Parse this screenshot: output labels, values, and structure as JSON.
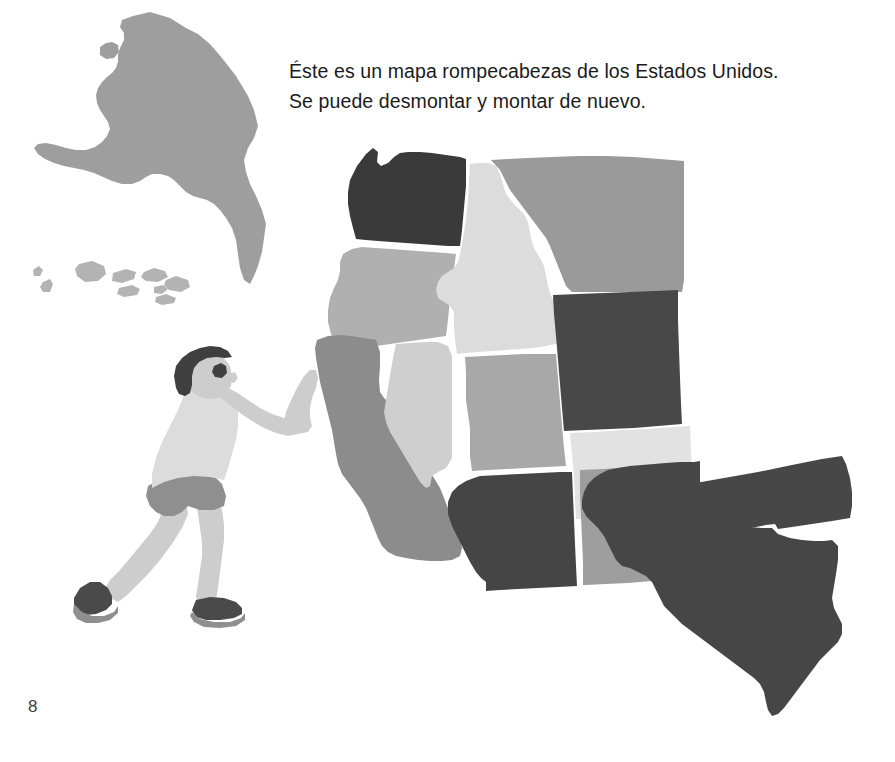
{
  "page": {
    "number": "8",
    "background_color": "#ffffff",
    "width": 895,
    "height": 762
  },
  "caption": {
    "line1": "Éste es un mapa rompecabezas de los Estados Unidos.",
    "line2": "Se puede desmontar y montar de nuevo.",
    "full_text": "Éste es un mapa rompecabezas de los Estados Unidos.\nSe puede desmontar y montar de nuevo.",
    "text_color": "#1b1b1b"
  },
  "illustration": {
    "title": "Boy pushing a jigsaw puzzle map of the United States",
    "figure": {
      "name": "boy",
      "action": "pushing-map",
      "colors": {
        "hair": "#3f3f3f",
        "skin": "#cdcdcd",
        "shirt": "#dcdcdc",
        "shorts": "#8f8f8f",
        "shoe_upper": "#4a4a4a",
        "shoe_sole": "#8f8f8f"
      }
    },
    "map": {
      "name": "usa-puzzle-map",
      "outline_color": "#ffffff",
      "pieces": [
        {
          "id": "alaska",
          "label": "Alaska",
          "color": "#9e9e9e",
          "detached": true
        },
        {
          "id": "hawaii",
          "label": "Hawaii",
          "color": "#b3b3b3",
          "detached": true
        },
        {
          "id": "washington",
          "label": "Washington",
          "color": "#3a3a3a",
          "detached": false
        },
        {
          "id": "oregon",
          "label": "Oregon",
          "color": "#b0b0b0",
          "detached": false
        },
        {
          "id": "idaho",
          "label": "Idaho",
          "color": "#dcdcdc",
          "detached": false
        },
        {
          "id": "montana",
          "label": "Montana",
          "color": "#9a9a9a",
          "detached": false
        },
        {
          "id": "wyoming",
          "label": "Wyoming",
          "color": "#484848",
          "detached": false
        },
        {
          "id": "california",
          "label": "California",
          "color": "#8c8c8c",
          "detached": false
        },
        {
          "id": "nevada",
          "label": "Nevada",
          "color": "#cfcfcf",
          "detached": false
        },
        {
          "id": "utah",
          "label": "Utah",
          "color": "#a8a8a8",
          "detached": false
        },
        {
          "id": "colorado",
          "label": "Colorado",
          "color": "#e2e2e2",
          "detached": false
        },
        {
          "id": "arizona",
          "label": "Arizona",
          "color": "#454545",
          "detached": false
        },
        {
          "id": "new-mexico",
          "label": "New Mexico",
          "color": "#9e9e9e",
          "detached": false
        },
        {
          "id": "oklahoma",
          "label": "Oklahoma",
          "color": "#474747",
          "detached": true
        },
        {
          "id": "texas",
          "label": "Texas",
          "color": "#464646",
          "detached": true
        }
      ]
    }
  }
}
